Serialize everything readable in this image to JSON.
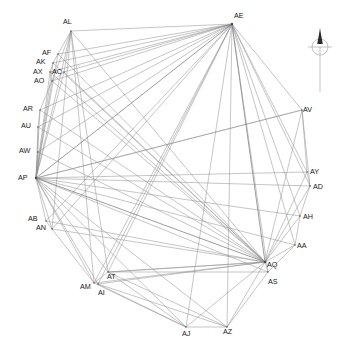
{
  "figure": {
    "type": "network-graph",
    "title": "",
    "background_color": "#ffffff",
    "edge_color": "#8c8c8c",
    "label_color": "#1a1a1a"
  },
  "compass": {
    "name": "north-arrow",
    "label": "",
    "direction": "north"
  },
  "chart_data": {
    "type": "scatter",
    "title": "",
    "xlabel": "",
    "ylabel": "",
    "grid": false,
    "legend": "none",
    "node_count": 24,
    "edge_count": 86,
    "nodes": [
      {
        "id": "AL",
        "label": "AL",
        "x": 71,
        "y": 31,
        "lx": 63,
        "ly": 22
      },
      {
        "id": "AE",
        "label": "AE",
        "x": 232,
        "y": 24,
        "lx": 234,
        "ly": 16
      },
      {
        "id": "AF",
        "label": "AF",
        "x": 58,
        "y": 54,
        "lx": 42,
        "ly": 53
      },
      {
        "id": "AK",
        "label": "AK",
        "x": 53,
        "y": 63,
        "lx": 36,
        "ly": 62
      },
      {
        "id": "AX",
        "label": "AX",
        "x": 50,
        "y": 72,
        "lx": 33,
        "ly": 72
      },
      {
        "id": "AC",
        "label": "AC",
        "x": 64,
        "y": 72,
        "lx": 52,
        "ly": 72
      },
      {
        "id": "AO",
        "label": "AO",
        "x": 52,
        "y": 81,
        "lx": 34,
        "ly": 81
      },
      {
        "id": "AR",
        "label": "AR",
        "x": 40,
        "y": 110,
        "lx": 23,
        "ly": 109
      },
      {
        "id": "AU",
        "label": "AU",
        "x": 38,
        "y": 127,
        "lx": 21,
        "ly": 126
      },
      {
        "id": "AW",
        "label": "AW",
        "x": 38,
        "y": 152,
        "lx": 19,
        "ly": 151
      },
      {
        "id": "AP",
        "label": "AP",
        "x": 36,
        "y": 178,
        "lx": 18,
        "ly": 178
      },
      {
        "id": "AB",
        "label": "AB",
        "x": 46,
        "y": 221,
        "lx": 28,
        "ly": 219
      },
      {
        "id": "AN",
        "label": "AN",
        "x": 52,
        "y": 229,
        "lx": 36,
        "ly": 228
      },
      {
        "id": "AM",
        "label": "AM",
        "x": 94,
        "y": 283,
        "lx": 80,
        "ly": 287
      },
      {
        "id": "AI",
        "label": "AI",
        "x": 98,
        "y": 284,
        "lx": 98,
        "ly": 293
      },
      {
        "id": "AT",
        "label": "AT",
        "x": 108,
        "y": 272,
        "lx": 107,
        "ly": 277
      },
      {
        "id": "AJ",
        "label": "AJ",
        "x": 186,
        "y": 327,
        "lx": 182,
        "ly": 334
      },
      {
        "id": "AZ",
        "label": "AZ",
        "x": 227,
        "y": 327,
        "lx": 223,
        "ly": 332
      },
      {
        "id": "AS",
        "label": "AS",
        "x": 268,
        "y": 272,
        "lx": 268,
        "ly": 282
      },
      {
        "id": "AQ",
        "label": "AQ",
        "x": 265,
        "y": 262,
        "lx": 267,
        "ly": 265
      },
      {
        "id": "AA",
        "label": "AA",
        "x": 295,
        "y": 245,
        "lx": 297,
        "ly": 246
      },
      {
        "id": "AH",
        "label": "AH",
        "x": 300,
        "y": 216,
        "lx": 303,
        "ly": 217
      },
      {
        "id": "AD",
        "label": "AD",
        "x": 310,
        "y": 186,
        "lx": 313,
        "ly": 187
      },
      {
        "id": "AY",
        "label": "AY",
        "x": 307,
        "y": 172,
        "lx": 310,
        "ly": 172
      },
      {
        "id": "AV",
        "label": "AV",
        "x": 302,
        "y": 110,
        "lx": 303,
        "ly": 110
      }
    ],
    "edges": [
      [
        "AL",
        "AE"
      ],
      [
        "AL",
        "AP"
      ],
      [
        "AL",
        "AM"
      ],
      [
        "AL",
        "AN"
      ],
      [
        "AL",
        "AT"
      ],
      [
        "AL",
        "AQ"
      ],
      [
        "AL",
        "AO"
      ],
      [
        "AL",
        "AC"
      ],
      [
        "AE",
        "AF"
      ],
      [
        "AE",
        "AK"
      ],
      [
        "AE",
        "AX"
      ],
      [
        "AE",
        "AC"
      ],
      [
        "AE",
        "AO"
      ],
      [
        "AE",
        "AR"
      ],
      [
        "AE",
        "AU"
      ],
      [
        "AE",
        "AW"
      ],
      [
        "AE",
        "AP"
      ],
      [
        "AE",
        "AB"
      ],
      [
        "AE",
        "AN"
      ],
      [
        "AE",
        "AM"
      ],
      [
        "AE",
        "AI"
      ],
      [
        "AE",
        "AT"
      ],
      [
        "AE",
        "AJ"
      ],
      [
        "AE",
        "AZ"
      ],
      [
        "AE",
        "AQ"
      ],
      [
        "AE",
        "AS"
      ],
      [
        "AE",
        "AA"
      ],
      [
        "AE",
        "AH"
      ],
      [
        "AE",
        "AD"
      ],
      [
        "AE",
        "AY"
      ],
      [
        "AE",
        "AV"
      ],
      [
        "AP",
        "AF"
      ],
      [
        "AP",
        "AK"
      ],
      [
        "AP",
        "AX"
      ],
      [
        "AP",
        "AC"
      ],
      [
        "AP",
        "AO"
      ],
      [
        "AP",
        "AR"
      ],
      [
        "AP",
        "AU"
      ],
      [
        "AP",
        "AW"
      ],
      [
        "AP",
        "AB"
      ],
      [
        "AP",
        "AN"
      ],
      [
        "AP",
        "AM"
      ],
      [
        "AP",
        "AI"
      ],
      [
        "AP",
        "AT"
      ],
      [
        "AP",
        "AJ"
      ],
      [
        "AP",
        "AZ"
      ],
      [
        "AP",
        "AQ"
      ],
      [
        "AP",
        "AS"
      ],
      [
        "AP",
        "AA"
      ],
      [
        "AP",
        "AH"
      ],
      [
        "AP",
        "AD"
      ],
      [
        "AP",
        "AY"
      ],
      [
        "AP",
        "AV"
      ],
      [
        "AQ",
        "AF"
      ],
      [
        "AQ",
        "AK"
      ],
      [
        "AQ",
        "AX"
      ],
      [
        "AQ",
        "AC"
      ],
      [
        "AQ",
        "AO"
      ],
      [
        "AQ",
        "AR"
      ],
      [
        "AQ",
        "AU"
      ],
      [
        "AQ",
        "AW"
      ],
      [
        "AQ",
        "AB"
      ],
      [
        "AQ",
        "AN"
      ],
      [
        "AQ",
        "AM"
      ],
      [
        "AQ",
        "AI"
      ],
      [
        "AQ",
        "AT"
      ],
      [
        "AQ",
        "AJ"
      ],
      [
        "AQ",
        "AZ"
      ],
      [
        "AQ",
        "AS"
      ],
      [
        "AQ",
        "AA"
      ],
      [
        "AQ",
        "AH"
      ],
      [
        "AQ",
        "AD"
      ],
      [
        "AQ",
        "AY"
      ],
      [
        "AQ",
        "AV"
      ],
      [
        "AV",
        "AD"
      ],
      [
        "AV",
        "AY"
      ],
      [
        "AD",
        "AH"
      ],
      [
        "AY",
        "AD"
      ],
      [
        "AH",
        "AA"
      ],
      [
        "AA",
        "AS"
      ],
      [
        "AS",
        "AZ"
      ],
      [
        "AZ",
        "AJ"
      ],
      [
        "AJ",
        "AM"
      ],
      [
        "AJ",
        "AI"
      ],
      [
        "AM",
        "AN"
      ],
      [
        "AN",
        "AB"
      ],
      [
        "AT",
        "AZ"
      ],
      [
        "AT",
        "AJ"
      ],
      [
        "AI",
        "AZ"
      ],
      [
        "AM",
        "AT"
      ],
      [
        "AR",
        "AU"
      ],
      [
        "AU",
        "AW"
      ],
      [
        "AW",
        "AP"
      ],
      [
        "AO",
        "AR"
      ],
      [
        "AX",
        "AO"
      ],
      [
        "AK",
        "AX"
      ],
      [
        "AF",
        "AK"
      ],
      [
        "AC",
        "AO"
      ],
      [
        "AL",
        "AF"
      ],
      [
        "AT",
        "AS"
      ],
      [
        "AT",
        "AQ"
      ],
      [
        "AV",
        "AP"
      ]
    ]
  }
}
